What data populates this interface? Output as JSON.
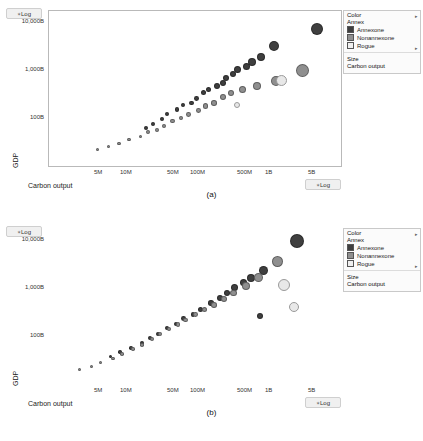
{
  "figure": {
    "caption_a": "(a)",
    "caption_b": "(b)"
  },
  "axes": {
    "y_axis_label": "GDP",
    "x_axis_label": "Carbon output",
    "y_scale_pill": "Log",
    "x_scale_pill": "Log",
    "y_ticks": [
      "10,000B",
      "1,000B",
      "100B"
    ],
    "x_ticks": [
      "5M",
      "10M",
      "50M",
      "100M",
      "500M",
      "1B",
      "5B"
    ]
  },
  "legend": {
    "color_title": "Color",
    "color_field": "Annex",
    "color_items": [
      {
        "label": "Annexone",
        "color": "#3f3f3f"
      },
      {
        "label": "Nonannexone",
        "color": "#8f8f8f"
      },
      {
        "label": "Rogue",
        "color": "#e8e8e8"
      }
    ],
    "size_title": "Size",
    "size_field": "Carbon output"
  },
  "chart_data": [
    {
      "id": "panel-a",
      "type": "scatter",
      "title": "(a)",
      "xlabel": "Carbon output",
      "ylabel": "GDP",
      "xscale": "log",
      "yscale": "log",
      "xlim": [
        2000000,
        9000000000
      ],
      "ylim": [
        20000000000,
        20000000000000
      ],
      "xticks": [
        "5M",
        "10M",
        "50M",
        "100M",
        "500M",
        "1B",
        "5B"
      ],
      "yticks": [
        "100B",
        "1,000B",
        "10,000B"
      ],
      "grid": false,
      "legend_position": "right",
      "size_encoding": "Carbon output",
      "color_encoding": "Annex",
      "series": [
        {
          "name": "Annexone",
          "color": "#3f3f3f",
          "points": [
            {
              "x": 4500000000,
              "y": 9000000000000,
              "r": 6
            },
            {
              "x": 1300000000,
              "y": 4200000000000,
              "r": 5
            },
            {
              "x": 900000000,
              "y": 2600000000000,
              "r": 4
            },
            {
              "x": 700000000,
              "y": 2100000000000,
              "r": 4
            },
            {
              "x": 600000000,
              "y": 1700000000000,
              "r": 3.5
            },
            {
              "x": 450000000,
              "y": 1500000000000,
              "r": 3.5
            },
            {
              "x": 400000000,
              "y": 1200000000000,
              "r": 3
            },
            {
              "x": 330000000,
              "y": 1000000000000,
              "r": 3
            },
            {
              "x": 300000000,
              "y": 800000000000,
              "r": 3
            },
            {
              "x": 250000000,
              "y": 700000000000,
              "r": 3
            },
            {
              "x": 200000000,
              "y": 600000000000,
              "r": 2.6
            },
            {
              "x": 170000000,
              "y": 520000000000,
              "r": 2.6
            },
            {
              "x": 140000000,
              "y": 400000000000,
              "r": 2.4
            },
            {
              "x": 120000000,
              "y": 330000000000,
              "r": 2.4
            },
            {
              "x": 95000000,
              "y": 300000000000,
              "r": 2.2
            },
            {
              "x": 80000000,
              "y": 250000000000,
              "r": 2.2
            },
            {
              "x": 60000000,
              "y": 200000000000,
              "r": 2
            },
            {
              "x": 52000000,
              "y": 160000000000,
              "r": 2
            },
            {
              "x": 40000000,
              "y": 130000000000,
              "r": 2
            },
            {
              "x": 33000000,
              "y": 110000000000,
              "r": 2
            }
          ]
        },
        {
          "name": "Nonannexone",
          "color": "#8f8f8f",
          "points": [
            {
              "x": 3000000000,
              "y": 1400000000000,
              "r": 6.5
            },
            {
              "x": 1400000000,
              "y": 900000000000,
              "r": 5
            },
            {
              "x": 800000000,
              "y": 700000000000,
              "r": 4
            },
            {
              "x": 520000000,
              "y": 600000000000,
              "r": 3.5
            },
            {
              "x": 380000000,
              "y": 520000000000,
              "r": 3
            },
            {
              "x": 300000000,
              "y": 430000000000,
              "r": 3
            },
            {
              "x": 230000000,
              "y": 330000000000,
              "r": 2.8
            },
            {
              "x": 180000000,
              "y": 290000000000,
              "r": 2.6
            },
            {
              "x": 150000000,
              "y": 240000000000,
              "r": 2.4
            },
            {
              "x": 110000000,
              "y": 200000000000,
              "r": 2.4
            },
            {
              "x": 90000000,
              "y": 170000000000,
              "r": 2.2
            },
            {
              "x": 70000000,
              "y": 150000000000,
              "r": 2.2
            },
            {
              "x": 55000000,
              "y": 120000000000,
              "r": 2
            },
            {
              "x": 45000000,
              "y": 100000000000,
              "r": 2
            },
            {
              "x": 35000000,
              "y": 90000000000,
              "r": 2
            },
            {
              "x": 28000000,
              "y": 75000000000,
              "r": 1.8
            },
            {
              "x": 20000000,
              "y": 65000000000,
              "r": 1.8
            },
            {
              "x": 15000000,
              "y": 55000000000,
              "r": 1.8
            },
            {
              "x": 11000000,
              "y": 48000000000,
              "r": 1.6
            },
            {
              "x": 8000000,
              "y": 42000000000,
              "r": 1.6
            }
          ]
        },
        {
          "name": "Rogue",
          "color": "#e8e8e8",
          "points": [
            {
              "x": 1600000000,
              "y": 900000000000,
              "r": 5.5
            },
            {
              "x": 450000000,
              "y": 300000000000,
              "r": 3
            }
          ]
        }
      ]
    },
    {
      "id": "panel-b",
      "type": "scatter",
      "title": "(b)",
      "xlabel": "Carbon output",
      "ylabel": "GDP",
      "xscale": "log",
      "yscale": "log",
      "xlim": [
        2000000,
        9000000000
      ],
      "ylim": [
        20000000000,
        20000000000000
      ],
      "xticks": [
        "5M",
        "10M",
        "50M",
        "100M",
        "500M",
        "1B",
        "5B"
      ],
      "yticks": [
        "100B",
        "1,000B",
        "10,000B"
      ],
      "grid": false,
      "legend_position": "right",
      "size_encoding": "Carbon output",
      "color_encoding": "Annex",
      "series": [
        {
          "name": "Annexone",
          "color": "#3f3f3f",
          "points": [
            {
              "x": 2600000000,
              "y": 11000000000000,
              "r": 7
            },
            {
              "x": 1000000000,
              "y": 3000000000000,
              "r": 4.5
            },
            {
              "x": 700000000,
              "y": 2200000000000,
              "r": 4
            },
            {
              "x": 560000000,
              "y": 1800000000000,
              "r": 3.5
            },
            {
              "x": 430000000,
              "y": 1400000000000,
              "r": 3.5
            },
            {
              "x": 350000000,
              "y": 1100000000000,
              "r": 3
            },
            {
              "x": 280000000,
              "y": 900000000000,
              "r": 3
            },
            {
              "x": 220000000,
              "y": 700000000000,
              "r": 2.8
            },
            {
              "x": 900000000,
              "y": 400000000000,
              "r": 3
            },
            {
              "x": 160000000,
              "y": 520000000000,
              "r": 2.6
            },
            {
              "x": 130000000,
              "y": 430000000000,
              "r": 2.4
            },
            {
              "x": 100000000,
              "y": 350000000000,
              "r": 2.4
            },
            {
              "x": 80000000,
              "y": 280000000000,
              "r": 2.2
            },
            {
              "x": 62000000,
              "y": 230000000000,
              "r": 2.2
            },
            {
              "x": 48000000,
              "y": 180000000000,
              "r": 2
            },
            {
              "x": 38000000,
              "y": 150000000000,
              "r": 2
            },
            {
              "x": 30000000,
              "y": 120000000000,
              "r": 2
            },
            {
              "x": 22000000,
              "y": 95000000000,
              "r": 1.8
            },
            {
              "x": 16000000,
              "y": 80000000000,
              "r": 1.8
            },
            {
              "x": 12000000,
              "y": 65000000000,
              "r": 1.6
            }
          ]
        },
        {
          "name": "Nonannexone",
          "color": "#8f8f8f",
          "points": [
            {
              "x": 1500000000,
              "y": 4500000000000,
              "r": 5.5
            },
            {
              "x": 850000000,
              "y": 2200000000000,
              "r": 4.5
            },
            {
              "x": 600000000,
              "y": 1500000000000,
              "r": 4
            },
            {
              "x": 420000000,
              "y": 1100000000000,
              "r": 3.2
            },
            {
              "x": 320000000,
              "y": 850000000000,
              "r": 3
            },
            {
              "x": 240000000,
              "y": 650000000000,
              "r": 2.8
            },
            {
              "x": 180000000,
              "y": 520000000000,
              "r": 2.6
            },
            {
              "x": 140000000,
              "y": 420000000000,
              "r": 2.4
            },
            {
              "x": 105000000,
              "y": 330000000000,
              "r": 2.4
            },
            {
              "x": 85000000,
              "y": 270000000000,
              "r": 2.2
            },
            {
              "x": 65000000,
              "y": 220000000000,
              "r": 2.2
            },
            {
              "x": 50000000,
              "y": 180000000000,
              "r": 2
            },
            {
              "x": 40000000,
              "y": 140000000000,
              "r": 2
            },
            {
              "x": 30000000,
              "y": 110000000000,
              "r": 1.8
            },
            {
              "x": 23000000,
              "y": 90000000000,
              "r": 1.8
            },
            {
              "x": 17000000,
              "y": 72000000000,
              "r": 1.8
            },
            {
              "x": 13000000,
              "y": 60000000000,
              "r": 1.6
            },
            {
              "x": 9000000,
              "y": 50000000000,
              "r": 1.6
            },
            {
              "x": 7000000,
              "y": 42000000000,
              "r": 1.5
            },
            {
              "x": 5000000,
              "y": 36000000000,
              "r": 1.5
            }
          ]
        },
        {
          "name": "Rogue",
          "color": "#e8e8e8",
          "points": [
            {
              "x": 1800000000,
              "y": 1600000000000,
              "r": 6
            },
            {
              "x": 2400000000,
              "y": 600000000000,
              "r": 5
            }
          ]
        }
      ]
    }
  ]
}
